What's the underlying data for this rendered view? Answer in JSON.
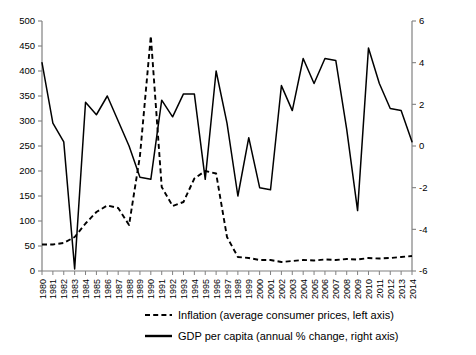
{
  "chart_data": {
    "type": "line",
    "title": "",
    "subtitle": "",
    "xlabel": "",
    "ylabel": "",
    "y2label": "",
    "grid": false,
    "legend_position": "bottom",
    "x": [
      1980,
      1981,
      1982,
      1983,
      1984,
      1985,
      1986,
      1987,
      1988,
      1989,
      1990,
      1991,
      1992,
      1993,
      1994,
      1995,
      1996,
      1997,
      1998,
      1999,
      2000,
      2001,
      2002,
      2003,
      2004,
      2005,
      2006,
      2007,
      2008,
      2009,
      2010,
      2011,
      2012,
      2013,
      2014
    ],
    "categories": [
      "1980",
      "1981",
      "1982",
      "1983",
      "1984",
      "1985",
      "1986",
      "1987",
      "1988",
      "1989",
      "1990",
      "1991",
      "1992",
      "1993",
      "1994",
      "1995",
      "1996",
      "1997",
      "1998",
      "1999",
      "2000",
      "2001",
      "2002",
      "2003",
      "2004",
      "2005",
      "2006",
      "2007",
      "2008",
      "2009",
      "2010",
      "2011",
      "2012",
      "2013",
      "2014"
    ],
    "axes": {
      "left": {
        "label": "Inflation (average consumer prices)",
        "min": 0,
        "max": 500,
        "tick_step": 50,
        "ticks": [
          0,
          50,
          100,
          150,
          200,
          250,
          300,
          350,
          400,
          450,
          500
        ],
        "tick_labels": [
          "0",
          "50",
          "100",
          "150",
          "200",
          "250",
          "300",
          "350",
          "400",
          "450",
          "500"
        ]
      },
      "right": {
        "label": "GDP per capita (annual % change)",
        "min": -6,
        "max": 6,
        "tick_step": 2,
        "ticks": [
          -6,
          -4,
          -2,
          0,
          2,
          4,
          6
        ],
        "tick_labels": [
          "-6",
          "-4",
          "-2",
          "0",
          "2",
          "4",
          "6"
        ]
      }
    },
    "series": [
      {
        "name": "Inflation (average consumer prices, left axis)",
        "axis": "left",
        "style": "dashed",
        "color": "#000000",
        "values": [
          53,
          53,
          56,
          68,
          95,
          118,
          131,
          126,
          92,
          230,
          470,
          168,
          130,
          138,
          185,
          200,
          195,
          68,
          28,
          26,
          22,
          22,
          18,
          20,
          22,
          21,
          23,
          22,
          24,
          23,
          26,
          25,
          26,
          28,
          30
        ]
      },
      {
        "name": "GDP per capita (annual % change, right axis)",
        "axis": "right",
        "style": "solid",
        "color": "#000000",
        "values": [
          4.0,
          1.1,
          0.2,
          -5.9,
          2.1,
          1.5,
          2.4,
          1.2,
          0.0,
          -1.5,
          -1.6,
          2.2,
          1.4,
          2.5,
          2.5,
          -1.6,
          3.6,
          1.1,
          -2.4,
          0.4,
          -2.0,
          -2.1,
          2.9,
          1.7,
          4.2,
          3.0,
          4.2,
          4.1,
          0.8,
          -3.1,
          4.7,
          3.0,
          1.8,
          1.7,
          0.2
        ]
      }
    ],
    "legend": [
      {
        "label": "Inflation (average consumer prices, left axis)",
        "style": "dashed"
      },
      {
        "label": "GDP per capita (annual % change, right axis)",
        "style": "solid"
      }
    ]
  }
}
